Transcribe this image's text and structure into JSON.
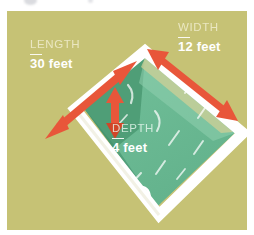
{
  "illustration": {
    "name": "swimming-pool-dimensions-diagram",
    "background_color": "#c6c275",
    "coping_color": "#ffffff",
    "water_light_color": "#6ebc96",
    "water_dark_color": "#4f9e77",
    "water_shadow_color": "#3f8c69",
    "arrow_color": "#e8563a",
    "arrow_color_dark": "#d14628"
  },
  "labels": {
    "length": {
      "title": "LENGTH",
      "value": "30 feet"
    },
    "width": {
      "title": "WIDTH",
      "value": "12 feet"
    },
    "depth": {
      "title": "DEPTH",
      "value": "4 feet"
    }
  },
  "features": {
    "ladder": "pool-ladder-handrails",
    "length_arrow": "length-dimension-arrow",
    "width_arrow": "width-dimension-arrow",
    "depth_arrow": "depth-dimension-arrow"
  }
}
